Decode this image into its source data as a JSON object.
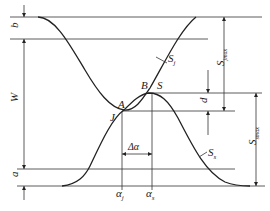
{
  "figure": {
    "type": "cam-lift-overlap-diagram",
    "curves": [
      {
        "id": "Sj",
        "label": "S",
        "subscript": "j",
        "description": "descending then rising curve"
      },
      {
        "id": "Ss",
        "label": "S",
        "subscript": "s",
        "description": "rising then descending curve"
      }
    ],
    "points": {
      "A": "A",
      "B": "B",
      "J": "J",
      "S": "S"
    },
    "dimensions": {
      "b": "b",
      "W": "W",
      "a": "a",
      "d": "d",
      "Sjmax_main": "S",
      "Sjmax_sub": "jmax",
      "Ssmax_main": "S",
      "Ssmax_sub": "smax",
      "delta_alpha": "Δα"
    },
    "axis_marks": {
      "alpha_j_main": "α",
      "alpha_j_sub": "j",
      "alpha_s_main": "α",
      "alpha_s_sub": "s"
    },
    "colors": {
      "line": "#333333",
      "curve": "#222222",
      "background": "#ffffff"
    }
  }
}
